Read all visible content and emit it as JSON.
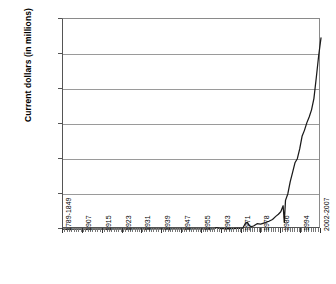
{
  "chart_data": {
    "type": "line",
    "title": "",
    "xlabel": "",
    "ylabel": "Current dollars (in millions)",
    "ylim": [
      0,
      3000000
    ],
    "ytick_labels": [
      "3,000,000",
      "2,500,000",
      "2,000,000",
      "1,500,000",
      "1,000,000",
      "500,000",
      "0"
    ],
    "ytick_values": [
      3000000,
      2500000,
      2000000,
      1500000,
      1000000,
      500000,
      0
    ],
    "xtick_labels": [
      "1789-1849",
      "1907",
      "1915",
      "1923",
      "1931",
      "1939",
      "1947",
      "1955",
      "1963",
      "1971",
      "1978",
      "1986",
      "1994",
      "2002-2007"
    ],
    "grid": true,
    "legend": false,
    "series": [
      {
        "name": "Current dollars (in millions)",
        "x": [
          1789,
          1855,
          1865,
          1875,
          1885,
          1895,
          1905,
          1910,
          1915,
          1917,
          1918,
          1919,
          1920,
          1922,
          1925,
          1930,
          1933,
          1936,
          1939,
          1941,
          1943,
          1944,
          1945,
          1946,
          1948,
          1950,
          1953,
          1956,
          1960,
          1963,
          1966,
          1969,
          1971,
          1973,
          1975,
          1976,
          1977,
          1979,
          1981,
          1983,
          1985,
          1987,
          1989,
          1991,
          1993,
          1995,
          1997,
          1999,
          2001,
          2003,
          2005,
          2007
        ],
        "values": [
          1,
          600,
          1300,
          600,
          400,
          500,
          700,
          900,
          1200,
          3000,
          15000,
          21000,
          11000,
          5500,
          4200,
          4000,
          5200,
          9000,
          9500,
          14000,
          79000,
          91000,
          93000,
          55000,
          33000,
          43000,
          76000,
          71000,
          92000,
          111000,
          135000,
          184000,
          211000,
          246000,
          332000,
          95000,
          409000,
          504000,
          678000,
          808000,
          946000,
          1004000,
          1144000,
          1324000,
          1409000,
          1516000,
          1601000,
          1702000,
          1863000,
          2160000,
          2472000,
          2730000
        ]
      }
    ],
    "annotations": [
      {
        "label": "transition quarter dip",
        "x": 1976,
        "y": 95000
      }
    ]
  },
  "axes": {
    "y_title": "Current dollars (in millions)"
  }
}
